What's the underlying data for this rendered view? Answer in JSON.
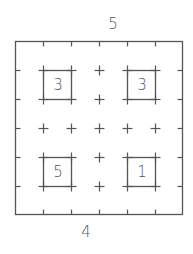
{
  "puzzle": {
    "type": "skyscraper-like grid",
    "grid_size": 6,
    "clues": {
      "top": "5",
      "bottom": "4"
    },
    "cells": [
      {
        "label": "3",
        "row": 1,
        "col": 1
      },
      {
        "label": "3",
        "row": 1,
        "col": 4
      },
      {
        "label": "5",
        "row": 3,
        "col": 1
      },
      {
        "label": "1",
        "row": 3,
        "col": 4
      }
    ],
    "colors": {
      "line": "#555555",
      "text": "#555555",
      "background": "#ffffff"
    }
  }
}
